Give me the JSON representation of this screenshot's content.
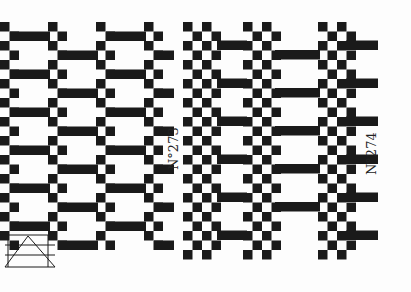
{
  "patterns": [
    {
      "id": "left",
      "label": "N°273"
    },
    {
      "id": "right",
      "label": "N°274"
    }
  ],
  "colors": {
    "ink": "#1a1a1a",
    "paper": "#fdfdfd"
  }
}
